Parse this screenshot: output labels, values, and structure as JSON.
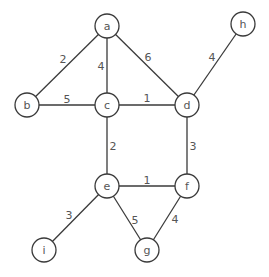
{
  "graph": {
    "nodes": [
      {
        "id": "a",
        "label": "a",
        "x": 107,
        "y": 26
      },
      {
        "id": "b",
        "label": "b",
        "x": 27,
        "y": 105
      },
      {
        "id": "c",
        "label": "c",
        "x": 107,
        "y": 105
      },
      {
        "id": "d",
        "label": "d",
        "x": 187,
        "y": 105
      },
      {
        "id": "h",
        "label": "h",
        "x": 243,
        "y": 24
      },
      {
        "id": "e",
        "label": "e",
        "x": 107,
        "y": 186
      },
      {
        "id": "f",
        "label": "f",
        "x": 187,
        "y": 186
      },
      {
        "id": "g",
        "label": "g",
        "x": 147,
        "y": 250
      },
      {
        "id": "i",
        "label": "i",
        "x": 44,
        "y": 250
      }
    ],
    "edges": [
      {
        "from": "a",
        "to": "b",
        "weight": "2",
        "lx": 63,
        "ly": 59
      },
      {
        "from": "a",
        "to": "c",
        "weight": "4",
        "lx": 101,
        "ly": 66
      },
      {
        "from": "a",
        "to": "d",
        "weight": "6",
        "lx": 148,
        "ly": 57
      },
      {
        "from": "b",
        "to": "c",
        "weight": "5",
        "lx": 67,
        "ly": 99
      },
      {
        "from": "c",
        "to": "d",
        "weight": "1",
        "lx": 147,
        "ly": 98
      },
      {
        "from": "d",
        "to": "h",
        "weight": "4",
        "lx": 212,
        "ly": 57
      },
      {
        "from": "c",
        "to": "e",
        "weight": "2",
        "lx": 113,
        "ly": 146
      },
      {
        "from": "d",
        "to": "f",
        "weight": "3",
        "lx": 193,
        "ly": 146
      },
      {
        "from": "e",
        "to": "f",
        "weight": "1",
        "lx": 147,
        "ly": 180
      },
      {
        "from": "e",
        "to": "i",
        "weight": "3",
        "lx": 69,
        "ly": 215
      },
      {
        "from": "e",
        "to": "g",
        "weight": "5",
        "lx": 135,
        "ly": 220
      },
      {
        "from": "f",
        "to": "g",
        "weight": "4",
        "lx": 175,
        "ly": 219
      }
    ]
  }
}
